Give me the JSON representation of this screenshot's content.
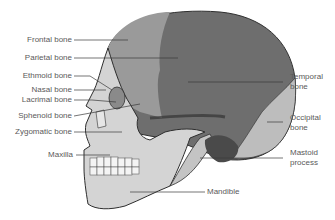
{
  "diagram": {
    "type": "anatomical-illustration",
    "colors": {
      "cranium_dark": "#6e6e6e",
      "frontal": "#9a9a9a",
      "occipital": "#bdbdbd",
      "face": "#d4d4d4",
      "outline": "#2e2e2e",
      "label_text": "#5a5a5a",
      "leader_line": "#3a3a3a"
    },
    "labels_left": [
      {
        "id": "frontal",
        "text": "Frontal bone"
      },
      {
        "id": "parietal",
        "text": "Parietal bone"
      },
      {
        "id": "ethmoid",
        "text": "Ethmoid bone"
      },
      {
        "id": "nasal",
        "text": "Nasal bone"
      },
      {
        "id": "lacrimal",
        "text": "Lacrimal bone"
      },
      {
        "id": "sphenoid",
        "text": "Sphenoid bone"
      },
      {
        "id": "zygomatic",
        "text": "Zygomatic bone"
      },
      {
        "id": "maxilla",
        "text": "Maxilla"
      }
    ],
    "labels_right": [
      {
        "id": "temporal",
        "line1": "Temporal",
        "line2": "bone"
      },
      {
        "id": "occipital",
        "line1": "Occipital",
        "line2": "bone"
      },
      {
        "id": "mastoid",
        "line1": "Mastoid",
        "line2": "process"
      }
    ],
    "labels_bottom": [
      {
        "id": "mandible",
        "text": "Mandible"
      }
    ]
  }
}
